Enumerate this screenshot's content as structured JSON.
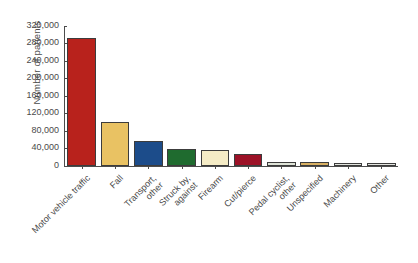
{
  "chart_data": {
    "type": "bar",
    "title": "",
    "subtitle": "",
    "xlabel": "",
    "ylabel": "Number of patients",
    "ylim": [
      0,
      320000
    ],
    "ytick_values": [
      0,
      40000,
      80000,
      120000,
      160000,
      200000,
      240000,
      280000,
      320000
    ],
    "ytick_labels": [
      "0",
      "40,000",
      "80,000",
      "120,000",
      "160,000",
      "200,000",
      "240,000",
      "280,000",
      "320,000"
    ],
    "grid": false,
    "legend": "none",
    "categories": [
      "Motor vehicle traffic",
      "Fall",
      "Transport, other",
      "Struck by, against",
      "Firearm",
      "Cut/pierce",
      "Pedal cyclist, other",
      "Unspecified",
      "Machinery",
      "Other"
    ],
    "values": [
      292000,
      100000,
      58000,
      40000,
      36000,
      28000,
      9000,
      9000,
      8000,
      8000
    ],
    "colors": [
      "#b8221c",
      "#e9c263",
      "#1c4c8a",
      "#1f6b2f",
      "#f5ecc6",
      "#9c1227",
      "#dfe4d8",
      "#d8b063",
      "#e2e4de",
      "#e4e5e0"
    ],
    "bar_edge_color": "#3c3c3c",
    "axis_color": "#4c4c4c",
    "text_color": "#4a4a4a",
    "background": "#ffffff"
  }
}
